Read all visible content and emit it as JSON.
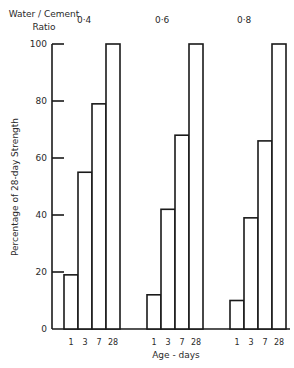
{
  "chart_data": {
    "type": "bar",
    "title": "",
    "legend_title": "Water / Cement Ratio",
    "legend_title_lines": [
      "Water / Cement",
      "Ratio"
    ],
    "xlabel": "Age - days",
    "ylabel": "Percentage of 28-day Strength",
    "ylim": [
      0,
      100
    ],
    "yticks": [
      0,
      20,
      40,
      60,
      80,
      100
    ],
    "grid": false,
    "categories": [
      "1",
      "3",
      "7",
      "28"
    ],
    "groups": [
      "0.4",
      "0.6",
      "0.8"
    ],
    "group_labels": [
      "0·4",
      "0·6",
      "0·8"
    ],
    "series": [
      {
        "name": "0.4",
        "values": [
          19,
          55,
          79,
          100
        ]
      },
      {
        "name": "0.6",
        "values": [
          12,
          42,
          68,
          100
        ]
      },
      {
        "name": "0.8",
        "values": [
          10,
          39,
          66,
          100
        ]
      }
    ]
  }
}
